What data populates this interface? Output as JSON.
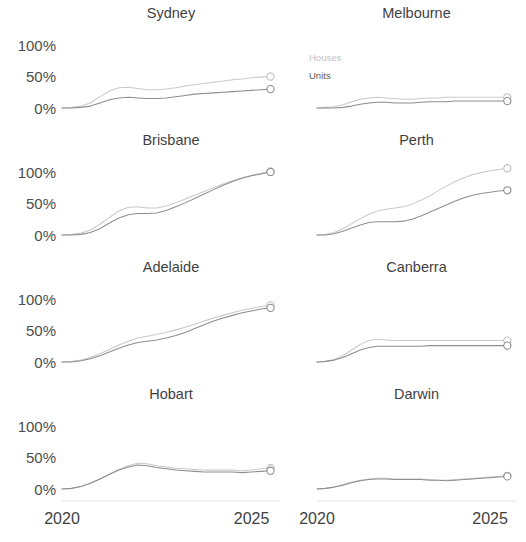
{
  "chart_data": {
    "type": "line",
    "title": "",
    "subtitle": "",
    "xlabel": "",
    "ylabel": "",
    "layout": {
      "rows": 4,
      "cols": 2,
      "shared_x": true,
      "shared_y": true,
      "grid": false,
      "legend_position": "inside-top-left-of-melbourne"
    },
    "xlim": [
      2020,
      2025.75
    ],
    "ylim": [
      -12,
      118
    ],
    "x_ticks": [
      2020,
      2025
    ],
    "x_tick_labels": [
      "2020",
      "2025"
    ],
    "y_ticks": [
      0,
      50,
      100
    ],
    "y_tick_labels": [
      "0%",
      "50%",
      "100%"
    ],
    "legend": [
      {
        "name": "Houses",
        "color": "#c9c9c9"
      },
      {
        "name": "Units",
        "color": "#8e8e8e"
      }
    ],
    "x": [
      2020.0,
      2020.25,
      2020.5,
      2020.75,
      2021.0,
      2021.25,
      2021.5,
      2021.75,
      2022.0,
      2022.25,
      2022.5,
      2022.75,
      2023.0,
      2023.25,
      2023.5,
      2023.75,
      2024.0,
      2024.25,
      2024.5,
      2024.75,
      2025.0,
      2025.25,
      2025.5
    ],
    "panels": [
      {
        "title": "Sydney",
        "series": [
          {
            "name": "Houses",
            "values": [
              0,
              1,
              3,
              8,
              18,
              27,
              32,
              33,
              31,
              29,
              29,
              30,
              32,
              35,
              37,
              39,
              41,
              43,
              45,
              46,
              48,
              49,
              50
            ],
            "endpoint_value": 50
          },
          {
            "name": "Units",
            "values": [
              0,
              0,
              1,
              3,
              8,
              13,
              16,
              17,
              16,
              15,
              15,
              16,
              18,
              20,
              22,
              23,
              24,
              25,
              26,
              27,
              28,
              29,
              30
            ],
            "endpoint_value": 30
          }
        ]
      },
      {
        "title": "Melbourne",
        "series": [
          {
            "name": "Houses",
            "values": [
              0,
              1,
              2,
              5,
              10,
              14,
              16,
              17,
              16,
              15,
              14,
              14,
              15,
              16,
              16,
              17,
              17,
              17,
              17,
              17,
              17,
              17,
              17
            ],
            "endpoint_value": 17
          },
          {
            "name": "Units",
            "values": [
              0,
              0,
              0,
              1,
              3,
              6,
              8,
              9,
              9,
              8,
              8,
              8,
              9,
              10,
              10,
              10,
              11,
              11,
              11,
              11,
              11,
              11,
              11
            ],
            "endpoint_value": 11
          }
        ]
      },
      {
        "title": "Brisbane",
        "series": [
          {
            "name": "Houses",
            "values": [
              0,
              1,
              3,
              8,
              17,
              28,
              38,
              44,
              45,
              43,
              43,
              46,
              51,
              57,
              63,
              69,
              75,
              81,
              86,
              91,
              95,
              98,
              101
            ],
            "endpoint_value": 101
          },
          {
            "name": "Units",
            "values": [
              0,
              0,
              1,
              4,
              10,
              19,
              27,
              32,
              34,
              34,
              35,
              39,
              45,
              51,
              58,
              65,
              72,
              79,
              85,
              90,
              94,
              97,
              100
            ],
            "endpoint_value": 100
          }
        ]
      },
      {
        "title": "Perth",
        "series": [
          {
            "name": "Houses",
            "values": [
              0,
              1,
              4,
              10,
              18,
              26,
              33,
              38,
              41,
              43,
              45,
              49,
              55,
              62,
              70,
              78,
              85,
              91,
              96,
              99,
              102,
              104,
              106
            ],
            "endpoint_value": 106
          },
          {
            "name": "Units",
            "values": [
              0,
              0,
              2,
              6,
              11,
              16,
              20,
              21,
              21,
              21,
              22,
              25,
              30,
              36,
              42,
              48,
              54,
              59,
              63,
              66,
              68,
              70,
              71
            ],
            "endpoint_value": 71
          }
        ]
      },
      {
        "title": "Adelaide",
        "series": [
          {
            "name": "Houses",
            "values": [
              0,
              1,
              3,
              7,
              13,
              20,
              27,
              33,
              38,
              41,
              44,
              47,
              51,
              55,
              60,
              65,
              70,
              74,
              78,
              82,
              85,
              88,
              90
            ],
            "endpoint_value": 90
          },
          {
            "name": "Units",
            "values": [
              0,
              0,
              2,
              5,
              10,
              16,
              22,
              27,
              31,
              33,
              35,
              38,
              42,
              47,
              53,
              59,
              65,
              70,
              74,
              78,
              81,
              84,
              86
            ],
            "endpoint_value": 86
          }
        ]
      },
      {
        "title": "Canberra",
        "series": [
          {
            "name": "Houses",
            "values": [
              0,
              1,
              4,
              10,
              19,
              28,
              34,
              36,
              35,
              34,
              34,
              34,
              34,
              34,
              34,
              34,
              34,
              34,
              34,
              34,
              34,
              34,
              34
            ],
            "endpoint_value": 34
          },
          {
            "name": "Units",
            "values": [
              0,
              1,
              3,
              7,
              13,
              19,
              23,
              25,
              25,
              25,
              25,
              25,
              25,
              26,
              26,
              26,
              26,
              26,
              26,
              26,
              26,
              26,
              26
            ],
            "endpoint_value": 26
          }
        ]
      },
      {
        "title": "Hobart",
        "series": [
          {
            "name": "Houses",
            "values": [
              0,
              1,
              4,
              9,
              16,
              24,
              31,
              37,
              41,
              40,
              37,
              35,
              33,
              32,
              31,
              30,
              30,
              30,
              30,
              29,
              30,
              32,
              33
            ],
            "endpoint_value": 33
          },
          {
            "name": "Units",
            "values": [
              0,
              1,
              4,
              9,
              16,
              23,
              30,
              35,
              38,
              37,
              34,
              32,
              30,
              29,
              28,
              27,
              27,
              27,
              27,
              26,
              27,
              28,
              29
            ],
            "endpoint_value": 29
          }
        ]
      },
      {
        "title": "Darwin",
        "series": [
          {
            "name": "Houses",
            "values": [
              0,
              1,
              3,
              7,
              11,
              14,
              16,
              17,
              17,
              16,
              16,
              16,
              16,
              15,
              14,
              14,
              15,
              16,
              17,
              18,
              19,
              20,
              21
            ],
            "endpoint_value": 21
          },
          {
            "name": "Units",
            "values": [
              0,
              1,
              3,
              6,
              10,
              13,
              15,
              16,
              16,
              15,
              15,
              15,
              15,
              14,
              14,
              13,
              14,
              15,
              16,
              17,
              18,
              19,
              20
            ],
            "endpoint_value": 20
          }
        ]
      }
    ]
  }
}
